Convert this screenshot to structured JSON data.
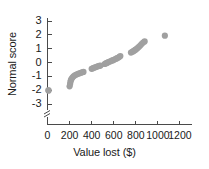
{
  "chart_data": {
    "type": "scatter",
    "title": "",
    "xlabel": "Value lost ($)",
    "ylabel": "Normal score",
    "xlim": [
      0,
      1250
    ],
    "ylim": [
      -3.45,
      3.3
    ],
    "grid": false,
    "legend": null,
    "axis_break": {
      "axis": "y",
      "below": -3,
      "symbol": "zigzag"
    },
    "xticks": [
      0,
      200,
      400,
      600,
      800,
      1000,
      1200
    ],
    "xtick_labels": [
      "0",
      "200",
      "400",
      "600",
      "800",
      "1000",
      "1200"
    ],
    "yticks": [
      3,
      2,
      1,
      0,
      -1,
      -2,
      -3
    ],
    "ytick_labels": [
      "3",
      "2",
      "1",
      "0",
      "-1",
      "-2",
      "-3"
    ],
    "marker": {
      "shape": "circle",
      "color": "#a0a0a0",
      "size": 3.1
    },
    "series": [
      {
        "name": "Normal probability plot",
        "points": [
          [
            8,
            -2.02
          ],
          [
            10,
            -2.02
          ],
          [
            200,
            -1.72
          ],
          [
            205,
            -1.55
          ],
          [
            208,
            -1.4
          ],
          [
            212,
            -1.28
          ],
          [
            218,
            -1.18
          ],
          [
            226,
            -1.09
          ],
          [
            236,
            -1.0
          ],
          [
            248,
            -0.93
          ],
          [
            262,
            -0.87
          ],
          [
            276,
            -0.82
          ],
          [
            290,
            -0.78
          ],
          [
            302,
            -0.74
          ],
          [
            314,
            -0.71
          ],
          [
            326,
            -0.68
          ],
          [
            400,
            -0.46
          ],
          [
            410,
            -0.42
          ],
          [
            420,
            -0.38
          ],
          [
            432,
            -0.35
          ],
          [
            444,
            -0.31
          ],
          [
            456,
            -0.28
          ],
          [
            468,
            -0.25
          ],
          [
            480,
            -0.22
          ],
          [
            518,
            -0.11
          ],
          [
            528,
            -0.07
          ],
          [
            538,
            -0.03
          ],
          [
            548,
            0.01
          ],
          [
            558,
            0.05
          ],
          [
            570,
            0.09
          ],
          [
            582,
            0.13
          ],
          [
            594,
            0.17
          ],
          [
            606,
            0.21
          ],
          [
            618,
            0.26
          ],
          [
            630,
            0.31
          ],
          [
            642,
            0.36
          ],
          [
            652,
            0.41
          ],
          [
            660,
            0.47
          ],
          [
            756,
            0.72
          ],
          [
            768,
            0.77
          ],
          [
            778,
            0.82
          ],
          [
            788,
            0.87
          ],
          [
            798,
            0.93
          ],
          [
            808,
            0.99
          ],
          [
            818,
            1.06
          ],
          [
            828,
            1.14
          ],
          [
            840,
            1.23
          ],
          [
            852,
            1.33
          ],
          [
            866,
            1.44
          ],
          [
            880,
            1.52
          ],
          [
            1063,
            1.94
          ]
        ]
      }
    ]
  },
  "axes": {
    "ylabel_text": "Normal score",
    "xlabel_text": "Value lost ($)"
  }
}
